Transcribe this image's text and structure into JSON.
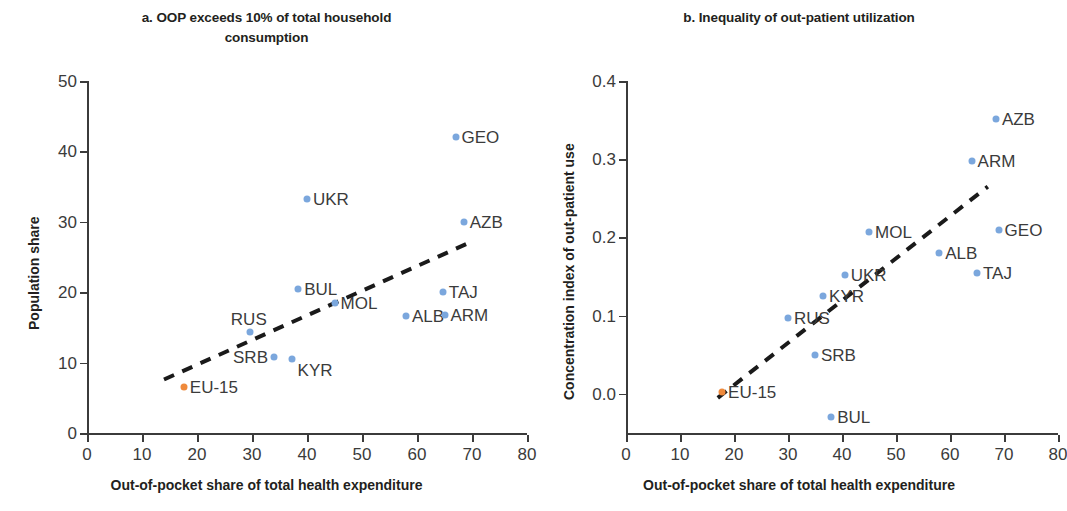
{
  "figure": {
    "background": "#ffffff",
    "point_color": "#7ba7dd",
    "highlight_color": "#ef8a3c",
    "trendline_color": "#1a1a1a"
  },
  "panel_a": {
    "title": "a. OOP exceeds 10% of total household consumption",
    "title_line1": "a. OOP exceeds 10% of total household",
    "title_line2": "consumption",
    "xlabel": "Out-of-pocket share of total health expenditure",
    "ylabel": "Population share",
    "xticks": [
      "0",
      "10",
      "20",
      "30",
      "40",
      "50",
      "60",
      "70",
      "80"
    ],
    "yticks": [
      "0",
      "10",
      "20",
      "30",
      "40",
      "50"
    ]
  },
  "panel_b": {
    "title": "b. Inequality of out-patient utilization",
    "title_line1": "b. Inequality of out-patient utilization",
    "title_line2": "",
    "xlabel": "Out-of-pocket share of total health expenditure",
    "ylabel": "Concentration index of out-patient use",
    "xticks": [
      "0",
      "10",
      "20",
      "30",
      "40",
      "50",
      "60",
      "70",
      "80"
    ],
    "yticks": [
      "0.0",
      "0.1",
      "0.2",
      "0.3",
      "0.4"
    ]
  },
  "chart_data": [
    {
      "type": "scatter",
      "panel": "a",
      "title": "a. OOP exceeds 10% of total household consumption",
      "xlabel": "Out-of-pocket share of total health expenditure",
      "ylabel": "Population share",
      "xlim": [
        0,
        80
      ],
      "ylim": [
        0,
        50
      ],
      "xticks": [
        0,
        10,
        20,
        30,
        40,
        50,
        60,
        70,
        80
      ],
      "yticks": [
        0,
        10,
        20,
        30,
        40,
        50
      ],
      "grid": false,
      "legend": "none",
      "points": [
        {
          "label": "EU-15",
          "x": 17.6,
          "y": 6.6,
          "highlight": true,
          "label_pos": "right"
        },
        {
          "label": "SRB",
          "x": 34.0,
          "y": 10.8,
          "highlight": false,
          "label_pos": "left"
        },
        {
          "label": "KYR",
          "x": 37.2,
          "y": 10.5,
          "highlight": false,
          "label_pos": "below-right"
        },
        {
          "label": "RUS",
          "x": 29.6,
          "y": 14.3,
          "highlight": false,
          "label_pos": "above"
        },
        {
          "label": "ALB",
          "x": 58.0,
          "y": 16.6,
          "highlight": false,
          "label_pos": "right"
        },
        {
          "label": "ARM",
          "x": 65.0,
          "y": 16.8,
          "highlight": false,
          "label_pos": "right"
        },
        {
          "label": "MOL",
          "x": 45.0,
          "y": 18.4,
          "highlight": false,
          "label_pos": "right"
        },
        {
          "label": "TAJ",
          "x": 64.7,
          "y": 20.0,
          "highlight": false,
          "label_pos": "right"
        },
        {
          "label": "BUL",
          "x": 38.4,
          "y": 20.4,
          "highlight": false,
          "label_pos": "right"
        },
        {
          "label": "AZB",
          "x": 68.5,
          "y": 30.0,
          "highlight": false,
          "label_pos": "right"
        },
        {
          "label": "UKR",
          "x": 40.0,
          "y": 33.3,
          "highlight": false,
          "label_pos": "right"
        },
        {
          "label": "GEO",
          "x": 67.0,
          "y": 42.0,
          "highlight": false,
          "label_pos": "right"
        }
      ],
      "trendline": {
        "x0": 14.0,
        "y0": 7.6,
        "x1": 70.0,
        "y1": 27.2,
        "style": "dashed"
      }
    },
    {
      "type": "scatter",
      "panel": "b",
      "title": "b. Inequality of out-patient utilization",
      "xlabel": "Out-of-pocket share of total health expenditure",
      "ylabel": "Concentration index of out-patient use",
      "xlim": [
        0,
        80
      ],
      "ylim": [
        -0.05,
        0.4
      ],
      "xticks": [
        0,
        10,
        20,
        30,
        40,
        50,
        60,
        70,
        80
      ],
      "yticks": [
        0.0,
        0.1,
        0.2,
        0.3,
        0.4
      ],
      "grid": false,
      "legend": "none",
      "points": [
        {
          "label": "BUL",
          "x": 38.0,
          "y": -0.03,
          "highlight": false,
          "label_pos": "right"
        },
        {
          "label": "EU-15",
          "x": 17.8,
          "y": 0.002,
          "highlight": true,
          "label_pos": "right"
        },
        {
          "label": "SRB",
          "x": 35.0,
          "y": 0.05,
          "highlight": false,
          "label_pos": "right"
        },
        {
          "label": "RUS",
          "x": 30.0,
          "y": 0.097,
          "highlight": false,
          "label_pos": "right"
        },
        {
          "label": "KYR",
          "x": 36.5,
          "y": 0.125,
          "highlight": false,
          "label_pos": "right"
        },
        {
          "label": "UKR",
          "x": 40.5,
          "y": 0.152,
          "highlight": false,
          "label_pos": "right"
        },
        {
          "label": "TAJ",
          "x": 65.0,
          "y": 0.155,
          "highlight": false,
          "label_pos": "right"
        },
        {
          "label": "ALB",
          "x": 58.0,
          "y": 0.18,
          "highlight": false,
          "label_pos": "right"
        },
        {
          "label": "MOL",
          "x": 45.0,
          "y": 0.207,
          "highlight": false,
          "label_pos": "right"
        },
        {
          "label": "GEO",
          "x": 69.0,
          "y": 0.21,
          "highlight": false,
          "label_pos": "right"
        },
        {
          "label": "ARM",
          "x": 64.0,
          "y": 0.298,
          "highlight": false,
          "label_pos": "right"
        },
        {
          "label": "AZB",
          "x": 68.5,
          "y": 0.351,
          "highlight": false,
          "label_pos": "right"
        }
      ],
      "trendline": {
        "x0": 17.0,
        "y0": -0.005,
        "x1": 67.0,
        "y1": 0.265,
        "style": "dashed"
      }
    }
  ]
}
